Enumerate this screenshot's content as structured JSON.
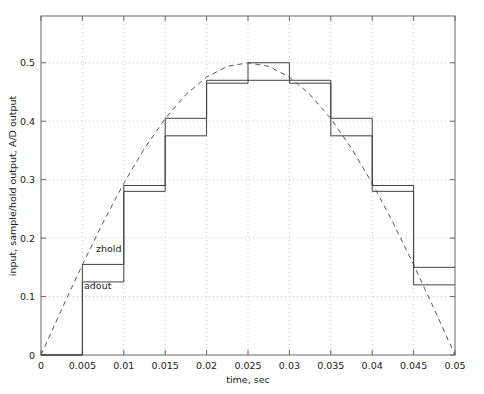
{
  "chart_data": {
    "type": "line",
    "title": "",
    "xlabel": "time, sec",
    "ylabel": "input, sample/hold output, A/D output",
    "xlim": [
      0,
      0.05
    ],
    "ylim": [
      0,
      0.58
    ],
    "grid": true,
    "legend_position": "inline-annotations",
    "xticks": [
      0,
      0.005,
      0.01,
      0.015,
      0.02,
      0.025,
      0.03,
      0.035,
      0.04,
      0.045,
      0.05
    ],
    "xticklabels": [
      "0",
      "0.005",
      "0.01",
      "0.015",
      "0.02",
      "0.025",
      "0.03",
      "0.035",
      "0.04",
      "0.045",
      "0.05"
    ],
    "yticks": [
      0,
      0.1,
      0.2,
      0.3,
      0.4,
      0.5
    ],
    "yticklabels": [
      "0",
      "0.1",
      "0.2",
      "0.3",
      "0.4",
      "0.5"
    ],
    "annotations": [
      {
        "text": "zhold",
        "x": 0.0108,
        "y": 0.185
      },
      {
        "text": "adout",
        "x": 0.0108,
        "y": 0.118
      }
    ],
    "series": [
      {
        "name": "input",
        "style": "dashed",
        "color": "#555555",
        "x": [
          0,
          0.0025,
          0.005,
          0.0075,
          0.01,
          0.0125,
          0.015,
          0.0175,
          0.02,
          0.0225,
          0.025,
          0.0275,
          0.03,
          0.0325,
          0.035,
          0.0375,
          0.04,
          0.0425,
          0.045,
          0.0475,
          0.05
        ],
        "y": [
          0,
          0.0782,
          0.1545,
          0.2269,
          0.2939,
          0.3536,
          0.4045,
          0.4455,
          0.4755,
          0.4938,
          0.5,
          0.4938,
          0.4755,
          0.4455,
          0.4045,
          0.3536,
          0.2939,
          0.2269,
          0.1545,
          0.0782,
          0
        ]
      },
      {
        "name": "zhold",
        "style": "staircase",
        "color": "#404040",
        "x": [
          0,
          0.005,
          0.01,
          0.015,
          0.02,
          0.025,
          0.03,
          0.035,
          0.04,
          0.045,
          0.05
        ],
        "y": [
          0,
          0.155,
          0.29,
          0.405,
          0.47,
          0.5,
          0.47,
          0.405,
          0.29,
          0.15,
          0.15
        ]
      },
      {
        "name": "adout",
        "style": "staircase",
        "color": "#404040",
        "x": [
          0,
          0.005,
          0.01,
          0.015,
          0.02,
          0.025,
          0.03,
          0.035,
          0.04,
          0.045,
          0.05
        ],
        "y": [
          0,
          0.125,
          0.28,
          0.375,
          0.465,
          0.47,
          0.465,
          0.375,
          0.28,
          0.12,
          0.12
        ]
      }
    ]
  },
  "axis": {
    "xlabel": "time, sec",
    "ylabel": "input, sample/hold output, A/D output"
  },
  "annotations": {
    "zhold": "zhold",
    "adout": "adout"
  },
  "xticklabels": {
    "t0": "0",
    "t1": "0.005",
    "t2": "0.01",
    "t3": "0.015",
    "t4": "0.02",
    "t5": "0.025",
    "t6": "0.03",
    "t7": "0.035",
    "t8": "0.04",
    "t9": "0.045",
    "t10": "0.05"
  },
  "yticklabels": {
    "v0": "0",
    "v1": "0.1",
    "v2": "0.2",
    "v3": "0.3",
    "v4": "0.4",
    "v5": "0.5"
  },
  "colors": {
    "axis": "#666666",
    "grid": "#c8c8c8",
    "input_curve": "#555555",
    "staircase": "#404040",
    "background": "#ffffff"
  }
}
